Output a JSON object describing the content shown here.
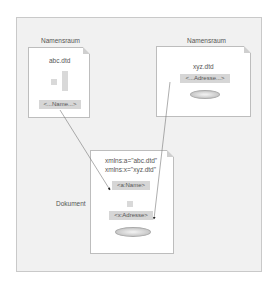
{
  "diagram": {
    "namespace_left": {
      "label": "Namensraum",
      "file": "abc.dtd",
      "element": "<...Name...>"
    },
    "namespace_right": {
      "label": "Namensraum",
      "file": "xyz.dtd",
      "element": "<...Adresse...>"
    },
    "document": {
      "label": "Dokument",
      "xmlns_a": "xmlns:a=\"abc.dtd\"",
      "xmlns_x": "xmlns:x=\"xyz.dtd\"",
      "element_a": "<a:Name>",
      "element_x": "<x:Adresse>"
    },
    "arrows": [
      {
        "from": "abc.dtd <...Name...>",
        "to": "<a:Name>"
      },
      {
        "from": "xyz.dtd <...Adresse...>",
        "to": "<x:Adresse>"
      }
    ]
  }
}
